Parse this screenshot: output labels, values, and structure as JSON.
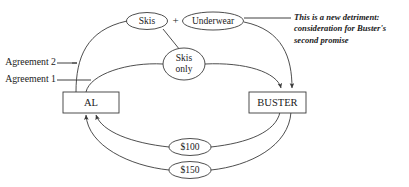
{
  "diagram": {
    "type": "contract-consideration-flow",
    "parties": [
      {
        "id": "al",
        "label": "AL",
        "shape": "rectangle"
      },
      {
        "id": "buster",
        "label": "BUSTER",
        "shape": "rectangle"
      }
    ],
    "consideration_nodes": [
      {
        "id": "skis",
        "label": "Skis",
        "shape": "oval"
      },
      {
        "id": "underwear",
        "label": "Underwear",
        "shape": "oval"
      },
      {
        "id": "skis-only",
        "label_line1": "Skis",
        "label_line2": "only",
        "shape": "oval"
      },
      {
        "id": "money-100",
        "label": "$100",
        "shape": "oval"
      },
      {
        "id": "money-150",
        "label": "$150",
        "shape": "oval"
      }
    ],
    "operators": [
      {
        "id": "plus",
        "label": "+"
      }
    ],
    "agreement_labels": [
      {
        "id": "agreement-2",
        "label": "Agreement 2"
      },
      {
        "id": "agreement-1",
        "label": "Agreement 1"
      }
    ],
    "annotation": {
      "id": "new-detriment-note",
      "line1": "This is a new detriment:",
      "line2": "consideration for Buster's",
      "line3": "second promise"
    },
    "colors": {
      "stroke": "#3a3a3a",
      "text": "#1a1a1a",
      "background": "#ffffff"
    }
  }
}
